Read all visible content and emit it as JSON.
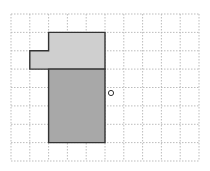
{
  "diagram": {
    "grid": {
      "columns": 10,
      "rows": 8,
      "x_lines": [
        11,
        29.8,
        48.6,
        67.4,
        86.2,
        105,
        123.8,
        142.6,
        161.4,
        180.2,
        199
      ],
      "y_lines": [
        14,
        32.4,
        50.8,
        69.1,
        87.5,
        105.9,
        124.3,
        142.6,
        161
      ],
      "line_color": "#b5b5b5"
    },
    "shapes": [
      {
        "name": "light-shape-top",
        "fill": "#cfcfcf",
        "stroke": "#333333",
        "cells_outline": "polygon covering cols 2-4 rows 1-2 plus col 1 row 2",
        "points": [
          [
            48.6,
            32.4
          ],
          [
            105,
            32.4
          ],
          [
            105,
            69.1
          ],
          [
            29.8,
            69.1
          ],
          [
            29.8,
            50.8
          ],
          [
            48.6,
            50.8
          ]
        ]
      },
      {
        "name": "dark-shape-bottom",
        "fill": "#a8a8a8",
        "stroke": "#333333",
        "cells_outline": "rectangle covering cols 2-4 rows 3-7",
        "points": [
          [
            48.6,
            69.1
          ],
          [
            105,
            69.1
          ],
          [
            105,
            142.6
          ],
          [
            48.6,
            142.6
          ]
        ]
      }
    ],
    "marker": {
      "name": "rotation-center-circle",
      "cx": 111,
      "cy": 93,
      "r": 2.6,
      "stroke": "#333333"
    }
  }
}
